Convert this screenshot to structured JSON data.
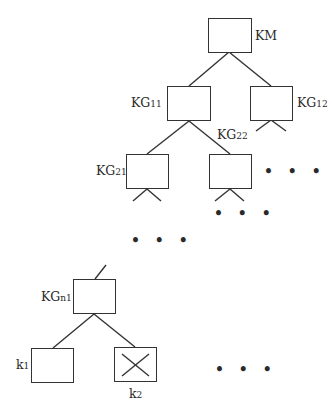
{
  "diagram": {
    "type": "key-hierarchy-tree",
    "nodes": [
      {
        "id": "km",
        "label": "KM",
        "base": "KM",
        "sub": ""
      },
      {
        "id": "kg11",
        "label": "KG11",
        "base": "KG",
        "sub": "11"
      },
      {
        "id": "kg12",
        "label": "KG12",
        "base": "KG",
        "sub": "12"
      },
      {
        "id": "kg21",
        "label": "KG21",
        "base": "KG",
        "sub": "21"
      },
      {
        "id": "kg22",
        "label": "KG22",
        "base": "KG",
        "sub": "22"
      },
      {
        "id": "kgn1",
        "label": "KGn1",
        "base": "KG",
        "sub": "n1"
      },
      {
        "id": "k1",
        "label": "k1",
        "base": "k",
        "sub": "1"
      },
      {
        "id": "k2",
        "label": "k2",
        "base": "k",
        "sub": "2",
        "marked": "crossed-out"
      }
    ],
    "edges": [
      [
        "km",
        "kg11"
      ],
      [
        "km",
        "kg12"
      ],
      [
        "kg11",
        "kg21"
      ],
      [
        "kg11",
        "kg22"
      ],
      [
        "kgn1",
        "k1"
      ],
      [
        "kgn1",
        "k2"
      ]
    ],
    "ellipsis": "• • •"
  }
}
